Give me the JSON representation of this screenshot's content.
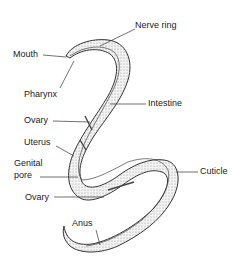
{
  "diagram": {
    "labels": {
      "nerve_ring": "Nerve ring",
      "mouth": "Mouth",
      "pharynx": "Pharynx",
      "intestine": "Intestine",
      "ovary_upper": "Ovary",
      "uterus": "Uterus",
      "genital_pore_1": "Genital",
      "genital_pore_2": "pore",
      "cuticle": "Cuticle",
      "ovary_lower": "Ovary",
      "anus": "Anus"
    },
    "colors": {
      "line": "#333333",
      "body_fill": "#e8e8e8",
      "background": "#ffffff"
    }
  }
}
